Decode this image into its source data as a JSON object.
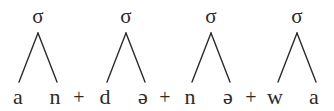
{
  "diagram": {
    "type": "syllable-structure-tree",
    "node_label": "σ",
    "boundary_symbol": "+",
    "transcription_line": "a n + d ə + n ə + w a",
    "colors": {
      "background": "#ffffff",
      "ink": "#2b2b2b"
    },
    "syllables": [
      {
        "node": "σ",
        "node_x": 38,
        "node_y": 6,
        "apex_x": 38,
        "segments": [
          {
            "text": "a",
            "x": 18,
            "y": 86
          },
          {
            "text": "n",
            "x": 55,
            "y": 86
          }
        ]
      },
      {
        "node": "σ",
        "node_x": 126,
        "node_y": 6,
        "apex_x": 126,
        "segments": [
          {
            "text": "d",
            "x": 105,
            "y": 86
          },
          {
            "text": "ə",
            "x": 143,
            "y": 86
          }
        ]
      },
      {
        "node": "σ",
        "node_x": 211,
        "node_y": 6,
        "apex_x": 211,
        "segments": [
          {
            "text": "n",
            "x": 190,
            "y": 86
          },
          {
            "text": "ə",
            "x": 228,
            "y": 86
          }
        ]
      },
      {
        "node": "σ",
        "node_x": 297,
        "node_y": 6,
        "apex_x": 297,
        "segments": [
          {
            "text": "w",
            "x": 275,
            "y": 86
          },
          {
            "text": "a",
            "x": 313,
            "y": 86
          }
        ]
      }
    ],
    "boundaries": [
      {
        "text": "+",
        "x": 79,
        "y": 87
      },
      {
        "text": "+",
        "x": 165,
        "y": 87
      },
      {
        "text": "+",
        "x": 251,
        "y": 87
      }
    ],
    "branch_geometry": {
      "apex_y": 33,
      "foot_y": 82,
      "half_span": 20,
      "stroke_width": 1.4
    }
  }
}
